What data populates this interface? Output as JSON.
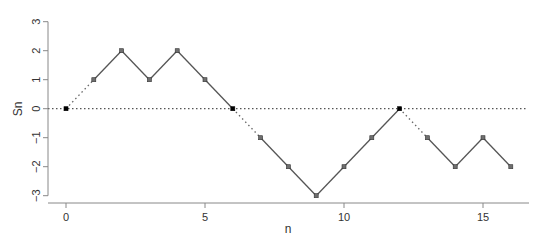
{
  "chart_data": {
    "type": "line",
    "title": "",
    "xlabel": "n",
    "ylabel": "Sn",
    "x": [
      0,
      1,
      2,
      3,
      4,
      5,
      6,
      7,
      8,
      9,
      10,
      11,
      12,
      13,
      14,
      15,
      16
    ],
    "series": [
      {
        "name": "Sn",
        "values": [
          0,
          1,
          2,
          1,
          2,
          1,
          0,
          -1,
          -2,
          -3,
          -2,
          -1,
          0,
          -1,
          -2,
          -1,
          -2
        ]
      }
    ],
    "xlim": [
      0,
      16
    ],
    "ylim": [
      -3,
      3
    ],
    "xticks": [
      0,
      5,
      10,
      15
    ],
    "yticks": [
      -3,
      -2,
      -1,
      0,
      1,
      2,
      3
    ],
    "reference_line": {
      "y": 0,
      "style": "dotted"
    },
    "segment_style_rule": "segments leaving a zero point (Sn=0) are dotted; others solid",
    "zero_point_color": "#000000",
    "point_color": "#6e6e6e",
    "line_color": "#555555",
    "axis_color": "#888888",
    "grid": false,
    "legend": null,
    "axes_style": "L (left and bottom only)"
  }
}
